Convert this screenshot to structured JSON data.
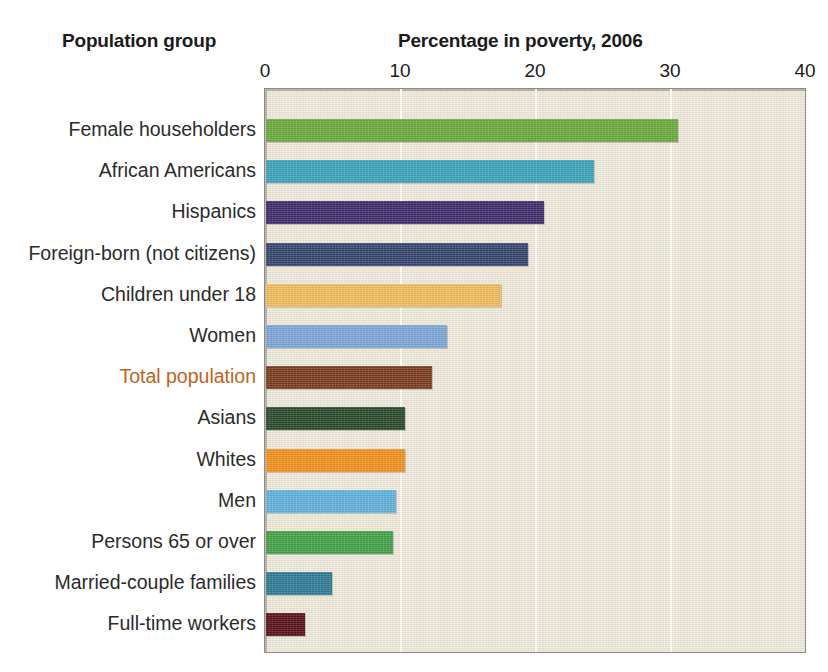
{
  "header": {
    "group_title": "Population group",
    "value_title": "Percentage in poverty, 2006"
  },
  "colors": {
    "plot_background": "#e8e2d2",
    "plot_border": "#8d8b82",
    "gridline": "#fbfaf5",
    "highlight_label": "#c0641d",
    "text": "#2b2b2b"
  },
  "chart_data": {
    "type": "bar",
    "orientation": "horizontal",
    "title": "Percentage in poverty, 2006",
    "xlabel": "Percentage in poverty, 2006",
    "ylabel": "Population group",
    "xlim": [
      0,
      40
    ],
    "xticks": [
      0,
      10,
      20,
      30,
      40
    ],
    "xtick_labels": [
      "0",
      "10",
      "20",
      "30",
      "40"
    ],
    "grid": true,
    "gridlines_at": [
      10,
      20,
      30
    ],
    "legend": null,
    "categories": [
      "Female householders",
      "African Americans",
      "Hispanics",
      "Foreign-born (not citizens)",
      "Children under 18",
      "Women",
      "Total population",
      "Asians",
      "Whites",
      "Men",
      "Persons 65 or over",
      "Married-couple families",
      "Full-time workers"
    ],
    "values": [
      30.5,
      24.3,
      20.6,
      19.4,
      17.4,
      13.4,
      12.3,
      10.3,
      10.3,
      9.6,
      9.4,
      4.9,
      2.9
    ],
    "bar_colors": [
      "#6aab3e",
      "#3da4be",
      "#3f2a6b",
      "#37456f",
      "#f5be5e",
      "#7fa8dc",
      "#7b3a1e",
      "#2a4a2a",
      "#f5921e",
      "#62b4dd",
      "#43a347",
      "#2e7d94",
      "#5c1018"
    ],
    "highlighted_category": "Total population"
  }
}
